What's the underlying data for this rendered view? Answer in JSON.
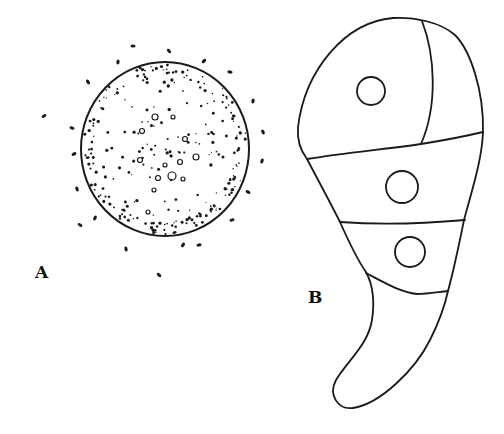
{
  "figure": {
    "panels": [
      {
        "id": "A",
        "label": "A",
        "description": "Spherical cell with granular cytoplasm surrounded by scattered particles",
        "circle": {
          "cx": 165,
          "cy": 149,
          "rx": 84,
          "ry": 87
        },
        "stroke_color": "#1a1a1a"
      },
      {
        "id": "B",
        "label": "B",
        "description": "Club-shaped multicellular body divided by septa into four compartments with three nuclei",
        "nuclei": [
          {
            "cx": 371,
            "cy": 91,
            "r": 14
          },
          {
            "cx": 402,
            "cy": 187,
            "r": 16
          },
          {
            "cx": 410,
            "cy": 252,
            "r": 15
          }
        ],
        "stroke_color": "#1a1a1a"
      }
    ],
    "background_color": "#ffffff"
  }
}
